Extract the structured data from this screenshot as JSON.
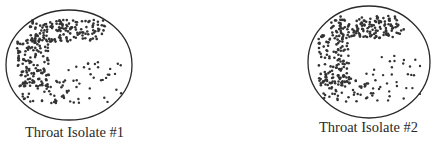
{
  "figure": {
    "plates": [
      {
        "id": 1,
        "label": "Throat Isolate #1",
        "description": "Petri dish with dense colony growth in a C-shaped band along top and left edge, sparse isolated colonies in lower right",
        "circle": {
          "cx": 69,
          "cy": 65,
          "rx": 63,
          "ry": 55
        }
      },
      {
        "id": 2,
        "label": "Throat Isolate #2",
        "description": "Petri dish with dense colony growth in a C-shaped band along top and left edge, sparse isolated colonies in lower right",
        "circle": {
          "cx": 369,
          "cy": 62,
          "rx": 61,
          "ry": 56
        }
      }
    ],
    "colors": {
      "outline": "#2a2a2a",
      "colony": "#333333",
      "background": "#ffffff"
    }
  }
}
